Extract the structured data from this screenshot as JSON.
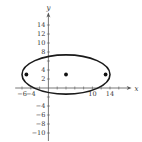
{
  "chart_data": {
    "type": "scatter",
    "title": "",
    "xlabel": "x",
    "ylabel": "y",
    "xlim": [
      -8,
      18
    ],
    "ylim": [
      -11,
      17
    ],
    "grid": false,
    "x_tick_labels": [
      {
        "value": -6,
        "label": "−6"
      },
      {
        "value": -4,
        "label": "−4"
      },
      {
        "value": 10,
        "label": "10"
      },
      {
        "value": 14,
        "label": "14"
      }
    ],
    "y_tick_labels": [
      {
        "value": 14,
        "label": "14"
      },
      {
        "value": 12,
        "label": "12"
      },
      {
        "value": 10,
        "label": "10"
      },
      {
        "value": 8,
        "label": "8"
      },
      {
        "value": 4,
        "label": "4"
      },
      {
        "value": 2,
        "label": "2"
      },
      {
        "value": -4,
        "label": "−4"
      },
      {
        "value": -6,
        "label": "−6"
      },
      {
        "value": -8,
        "label": "−8"
      },
      {
        "value": -10,
        "label": "−10"
      }
    ],
    "x_ticks": [
      -6,
      -4,
      -2,
      2,
      4,
      6,
      8,
      10,
      12,
      14,
      16
    ],
    "y_ticks": [
      -10,
      -8,
      -6,
      -4,
      -2,
      2,
      4,
      6,
      8,
      10,
      12,
      14
    ],
    "curves": [
      {
        "name": "ellipse",
        "shape": "ellipse",
        "center": [
          4,
          3
        ],
        "semi_major_axis": 10,
        "semi_minor_axis": 4.36,
        "vertices": [
          [
            -6,
            3
          ],
          [
            14,
            3
          ]
        ]
      }
    ],
    "points": [
      {
        "name": "focus-left",
        "x": -5,
        "y": 3
      },
      {
        "name": "center",
        "x": 4,
        "y": 3
      },
      {
        "name": "focus-right",
        "x": 13,
        "y": 3
      }
    ]
  },
  "colors": {
    "curve": "#1a1a1a",
    "axis": "#555555",
    "points": "#111111"
  }
}
